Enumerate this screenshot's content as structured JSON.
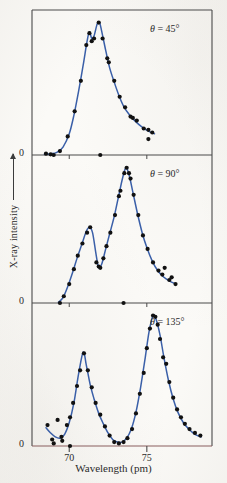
{
  "figure": {
    "xaxis_title": "Wavelength (pm)",
    "yaxis_title": "X-ray intensity",
    "zero_label": "0",
    "curve_color": "#3a5fa8",
    "point_color": "#111111",
    "axis_color": "#4a4a4a",
    "baseline_color": "#8a5f5f"
  },
  "axis": {
    "x_ticks": [
      70,
      75
    ],
    "x_tick_labels": [
      "70",
      "75"
    ],
    "x_min": 67.6,
    "x_max": 79.2
  },
  "chart_data": {
    "type": "scatter",
    "title": "",
    "xlabel": "Wavelength (pm)",
    "ylabel": "X-ray intensity",
    "xlim": [
      67.6,
      79.2
    ],
    "ylim": [
      0,
      1.05
    ],
    "grid": false,
    "legend_position": "inside-top-right",
    "panels": [
      {
        "label": "θ = 45°",
        "theta_symbol": "θ",
        "theta_value": "45°",
        "peaks": [
          {
            "name": "unshifted",
            "wavelength": 71.3,
            "intensity": 0.93
          },
          {
            "name": "compton-shifted",
            "wavelength": 71.9,
            "intensity": 1.0
          }
        ],
        "curve": [
          {
            "x": 68.4,
            "y": 0.005
          },
          {
            "x": 68.8,
            "y": 0.01
          },
          {
            "x": 69.2,
            "y": 0.02
          },
          {
            "x": 69.6,
            "y": 0.06
          },
          {
            "x": 70.0,
            "y": 0.16
          },
          {
            "x": 70.3,
            "y": 0.3
          },
          {
            "x": 70.6,
            "y": 0.48
          },
          {
            "x": 70.9,
            "y": 0.68
          },
          {
            "x": 71.15,
            "y": 0.86
          },
          {
            "x": 71.3,
            "y": 0.93
          },
          {
            "x": 71.45,
            "y": 0.88
          },
          {
            "x": 71.6,
            "y": 0.9
          },
          {
            "x": 71.8,
            "y": 0.99
          },
          {
            "x": 71.95,
            "y": 1.0
          },
          {
            "x": 72.1,
            "y": 0.93
          },
          {
            "x": 72.35,
            "y": 0.79
          },
          {
            "x": 72.6,
            "y": 0.66
          },
          {
            "x": 72.9,
            "y": 0.55
          },
          {
            "x": 73.2,
            "y": 0.45
          },
          {
            "x": 73.5,
            "y": 0.37
          },
          {
            "x": 73.9,
            "y": 0.3
          },
          {
            "x": 74.3,
            "y": 0.25
          },
          {
            "x": 74.7,
            "y": 0.21
          },
          {
            "x": 75.1,
            "y": 0.18
          },
          {
            "x": 75.5,
            "y": 0.16
          }
        ],
        "points": [
          {
            "x": 68.5,
            "y": 0.01
          },
          {
            "x": 68.8,
            "y": 0.005
          },
          {
            "x": 69.0,
            "y": 0.0
          },
          {
            "x": 69.4,
            "y": 0.03
          },
          {
            "x": 69.9,
            "y": 0.14
          },
          {
            "x": 70.35,
            "y": 0.33
          },
          {
            "x": 70.75,
            "y": 0.56
          },
          {
            "x": 71.1,
            "y": 0.83
          },
          {
            "x": 71.3,
            "y": 0.92
          },
          {
            "x": 71.45,
            "y": 0.86
          },
          {
            "x": 71.6,
            "y": 0.88
          },
          {
            "x": 71.9,
            "y": 1.0
          },
          {
            "x": 72.15,
            "y": 0.88
          },
          {
            "x": 72.45,
            "y": 0.73
          },
          {
            "x": 72.55,
            "y": 0.7
          },
          {
            "x": 72.9,
            "y": 0.56
          },
          {
            "x": 73.25,
            "y": 0.44
          },
          {
            "x": 73.6,
            "y": 0.36
          },
          {
            "x": 73.95,
            "y": 0.29
          },
          {
            "x": 74.1,
            "y": 0.28
          },
          {
            "x": 74.35,
            "y": 0.26
          },
          {
            "x": 74.8,
            "y": 0.2
          },
          {
            "x": 75.1,
            "y": 0.19
          },
          {
            "x": 75.35,
            "y": 0.17
          },
          {
            "x": 75.1,
            "y": 0.12
          },
          {
            "x": 72.0,
            "y": 0.0
          }
        ]
      },
      {
        "label": "θ = 90°",
        "theta_symbol": "θ",
        "theta_value": "90°",
        "peaks": [
          {
            "name": "unshifted",
            "wavelength": 71.3,
            "intensity": 0.56
          },
          {
            "name": "compton-shifted",
            "wavelength": 73.6,
            "intensity": 1.0
          }
        ],
        "curve": [
          {
            "x": 69.3,
            "y": 0.005
          },
          {
            "x": 69.6,
            "y": 0.04
          },
          {
            "x": 69.9,
            "y": 0.12
          },
          {
            "x": 70.2,
            "y": 0.22
          },
          {
            "x": 70.5,
            "y": 0.33
          },
          {
            "x": 70.8,
            "y": 0.43
          },
          {
            "x": 71.1,
            "y": 0.53
          },
          {
            "x": 71.3,
            "y": 0.56
          },
          {
            "x": 71.5,
            "y": 0.52
          },
          {
            "x": 71.7,
            "y": 0.38
          },
          {
            "x": 71.85,
            "y": 0.28
          },
          {
            "x": 71.95,
            "y": 0.26
          },
          {
            "x": 72.1,
            "y": 0.29
          },
          {
            "x": 72.35,
            "y": 0.4
          },
          {
            "x": 72.6,
            "y": 0.51
          },
          {
            "x": 72.9,
            "y": 0.64
          },
          {
            "x": 73.2,
            "y": 0.8
          },
          {
            "x": 73.45,
            "y": 0.93
          },
          {
            "x": 73.65,
            "y": 1.0
          },
          {
            "x": 73.85,
            "y": 0.95
          },
          {
            "x": 74.1,
            "y": 0.82
          },
          {
            "x": 74.4,
            "y": 0.66
          },
          {
            "x": 74.7,
            "y": 0.52
          },
          {
            "x": 75.0,
            "y": 0.41
          },
          {
            "x": 75.35,
            "y": 0.31
          },
          {
            "x": 75.7,
            "y": 0.24
          },
          {
            "x": 76.1,
            "y": 0.19
          },
          {
            "x": 76.5,
            "y": 0.16
          },
          {
            "x": 76.9,
            "y": 0.14
          }
        ],
        "points": [
          {
            "x": 69.4,
            "y": 0.0
          },
          {
            "x": 69.65,
            "y": 0.05
          },
          {
            "x": 70.0,
            "y": 0.14
          },
          {
            "x": 70.3,
            "y": 0.25
          },
          {
            "x": 70.55,
            "y": 0.35
          },
          {
            "x": 70.85,
            "y": 0.44
          },
          {
            "x": 71.15,
            "y": 0.52
          },
          {
            "x": 71.35,
            "y": 0.56
          },
          {
            "x": 71.75,
            "y": 0.3
          },
          {
            "x": 71.9,
            "y": 0.27
          },
          {
            "x": 72.0,
            "y": 0.26
          },
          {
            "x": 72.2,
            "y": 0.33
          },
          {
            "x": 72.4,
            "y": 0.42
          },
          {
            "x": 72.65,
            "y": 0.52
          },
          {
            "x": 72.95,
            "y": 0.65
          },
          {
            "x": 73.2,
            "y": 0.79
          },
          {
            "x": 73.3,
            "y": 0.83
          },
          {
            "x": 73.55,
            "y": 0.96
          },
          {
            "x": 73.7,
            "y": 1.0
          },
          {
            "x": 73.85,
            "y": 0.96
          },
          {
            "x": 73.95,
            "y": 0.92
          },
          {
            "x": 74.15,
            "y": 0.8
          },
          {
            "x": 74.45,
            "y": 0.65
          },
          {
            "x": 74.75,
            "y": 0.5
          },
          {
            "x": 75.05,
            "y": 0.4
          },
          {
            "x": 75.4,
            "y": 0.3
          },
          {
            "x": 75.75,
            "y": 0.24
          },
          {
            "x": 76.0,
            "y": 0.21
          },
          {
            "x": 76.15,
            "y": 0.26
          },
          {
            "x": 76.45,
            "y": 0.17
          },
          {
            "x": 76.6,
            "y": 0.19
          },
          {
            "x": 76.85,
            "y": 0.14
          },
          {
            "x": 73.5,
            "y": 0.0
          }
        ]
      },
      {
        "label": "θ = 135°",
        "theta_symbol": "θ",
        "theta_value": "135°",
        "peaks": [
          {
            "name": "unshifted",
            "wavelength": 70.9,
            "intensity": 0.72
          },
          {
            "name": "compton-shifted",
            "wavelength": 75.4,
            "intensity": 1.0
          }
        ],
        "curve": [
          {
            "x": 68.5,
            "y": 0.14
          },
          {
            "x": 68.8,
            "y": 0.1
          },
          {
            "x": 69.1,
            "y": 0.07
          },
          {
            "x": 69.4,
            "y": 0.06
          },
          {
            "x": 69.7,
            "y": 0.09
          },
          {
            "x": 70.0,
            "y": 0.18
          },
          {
            "x": 70.3,
            "y": 0.33
          },
          {
            "x": 70.6,
            "y": 0.55
          },
          {
            "x": 70.9,
            "y": 0.72
          },
          {
            "x": 71.1,
            "y": 0.62
          },
          {
            "x": 71.35,
            "y": 0.47
          },
          {
            "x": 71.6,
            "y": 0.36
          },
          {
            "x": 71.9,
            "y": 0.25
          },
          {
            "x": 72.2,
            "y": 0.17
          },
          {
            "x": 72.5,
            "y": 0.1
          },
          {
            "x": 72.8,
            "y": 0.05
          },
          {
            "x": 73.1,
            "y": 0.03
          },
          {
            "x": 73.4,
            "y": 0.03
          },
          {
            "x": 73.7,
            "y": 0.06
          },
          {
            "x": 74.0,
            "y": 0.13
          },
          {
            "x": 74.3,
            "y": 0.26
          },
          {
            "x": 74.6,
            "y": 0.45
          },
          {
            "x": 74.9,
            "y": 0.68
          },
          {
            "x": 75.15,
            "y": 0.88
          },
          {
            "x": 75.4,
            "y": 1.0
          },
          {
            "x": 75.6,
            "y": 0.97
          },
          {
            "x": 75.85,
            "y": 0.85
          },
          {
            "x": 76.1,
            "y": 0.68
          },
          {
            "x": 76.4,
            "y": 0.5
          },
          {
            "x": 76.7,
            "y": 0.36
          },
          {
            "x": 77.0,
            "y": 0.26
          },
          {
            "x": 77.35,
            "y": 0.18
          },
          {
            "x": 77.7,
            "y": 0.13
          },
          {
            "x": 78.1,
            "y": 0.09
          },
          {
            "x": 78.5,
            "y": 0.07
          }
        ],
        "points": [
          {
            "x": 68.6,
            "y": 0.16
          },
          {
            "x": 68.9,
            "y": 0.05
          },
          {
            "x": 69.0,
            "y": 0.02
          },
          {
            "x": 69.25,
            "y": 0.2
          },
          {
            "x": 69.5,
            "y": 0.07
          },
          {
            "x": 69.55,
            "y": 0.04
          },
          {
            "x": 69.85,
            "y": 0.16
          },
          {
            "x": 70.05,
            "y": 0.22
          },
          {
            "x": 70.25,
            "y": 0.33
          },
          {
            "x": 70.5,
            "y": 0.46
          },
          {
            "x": 70.7,
            "y": 0.58
          },
          {
            "x": 70.95,
            "y": 0.71
          },
          {
            "x": 71.2,
            "y": 0.58
          },
          {
            "x": 71.45,
            "y": 0.45
          },
          {
            "x": 71.7,
            "y": 0.33
          },
          {
            "x": 72.0,
            "y": 0.24
          },
          {
            "x": 72.3,
            "y": 0.15
          },
          {
            "x": 72.6,
            "y": 0.08
          },
          {
            "x": 72.9,
            "y": 0.03
          },
          {
            "x": 73.2,
            "y": 0.02
          },
          {
            "x": 73.5,
            "y": 0.03
          },
          {
            "x": 73.75,
            "y": 0.06
          },
          {
            "x": 74.05,
            "y": 0.13
          },
          {
            "x": 74.3,
            "y": 0.25
          },
          {
            "x": 74.55,
            "y": 0.4
          },
          {
            "x": 74.8,
            "y": 0.56
          },
          {
            "x": 75.0,
            "y": 0.75
          },
          {
            "x": 75.2,
            "y": 0.9
          },
          {
            "x": 75.4,
            "y": 1.0
          },
          {
            "x": 75.55,
            "y": 0.99
          },
          {
            "x": 75.7,
            "y": 0.93
          },
          {
            "x": 75.85,
            "y": 0.82
          },
          {
            "x": 76.05,
            "y": 0.68
          },
          {
            "x": 76.25,
            "y": 0.63
          },
          {
            "x": 76.45,
            "y": 0.49
          },
          {
            "x": 76.7,
            "y": 0.37
          },
          {
            "x": 76.95,
            "y": 0.28
          },
          {
            "x": 77.2,
            "y": 0.22
          },
          {
            "x": 77.45,
            "y": 0.17
          },
          {
            "x": 77.75,
            "y": 0.13
          },
          {
            "x": 78.1,
            "y": 0.1
          },
          {
            "x": 78.45,
            "y": 0.08
          },
          {
            "x": 70.05,
            "y": 0.0
          }
        ]
      }
    ]
  }
}
